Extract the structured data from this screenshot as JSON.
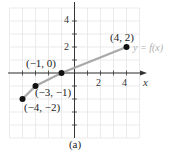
{
  "chart_data": {
    "type": "line",
    "title": "",
    "caption": "(a)",
    "function_label": "y = f(x)",
    "xlabel": "x",
    "ylabel": "y",
    "xlim": [
      -5,
      5
    ],
    "ylim": [
      -5,
      5
    ],
    "grid": true,
    "x_ticks": [
      2,
      4
    ],
    "y_ticks": [
      2,
      4
    ],
    "series": [
      {
        "name": "y = f(x)",
        "color": "#a8a8a8",
        "x": [
          -4,
          -3,
          -1,
          4
        ],
        "y": [
          -2,
          -1,
          0,
          2
        ]
      }
    ],
    "points": [
      {
        "x": -4,
        "y": -2,
        "label": "(−4, −2)"
      },
      {
        "x": -3,
        "y": -1,
        "label": "(−3, −1)"
      },
      {
        "x": -1,
        "y": 0,
        "label": "(−1, 0)"
      },
      {
        "x": 4,
        "y": 2,
        "label": "(4, 2)"
      }
    ]
  },
  "labels": {
    "p1": "(−4, −2)",
    "p2": "(−3, −1)",
    "p3": "(−1, 0)",
    "p4": "(4, 2)",
    "fn": "y = f(x)",
    "x": "x",
    "y": "y",
    "xt2": "2",
    "xt4": "4",
    "yt2": "2",
    "yt4": "4",
    "caption": "(a)"
  }
}
